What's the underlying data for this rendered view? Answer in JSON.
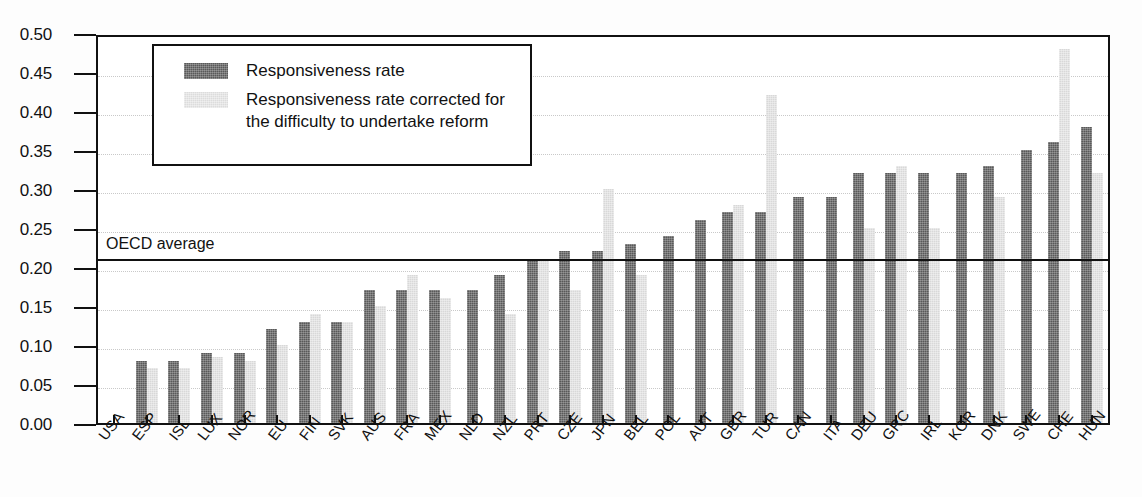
{
  "chart_data": {
    "type": "bar",
    "title": "",
    "subtitle": "",
    "xlabel": "",
    "ylabel": "",
    "ylim": [
      0.0,
      0.5
    ],
    "ytick_labels": [
      "0.50",
      "0.45",
      "0.40",
      "0.35",
      "0.30",
      "0.25",
      "0.20",
      "0.15",
      "0.10",
      "0.05",
      "0.00"
    ],
    "ytick_values": [
      0.5,
      0.45,
      0.4,
      0.35,
      0.3,
      0.25,
      0.2,
      0.15,
      0.1,
      0.05,
      0.0
    ],
    "grid": true,
    "legend_position": "upper-left-inside",
    "categories": [
      "USA",
      "ESP",
      "ISL",
      "LUX",
      "NOR",
      "EU",
      "FIN",
      "SVK",
      "AUS",
      "FRA",
      "MEX",
      "NLD",
      "NZL",
      "PRT",
      "CZE",
      "JPN",
      "BEL",
      "POL",
      "AUT",
      "GBR",
      "TUR",
      "CAN",
      "ITA",
      "DEU",
      "GRC",
      "IRL",
      "KOR",
      "DNK",
      "SWE",
      "CHE",
      "HUN"
    ],
    "series": [
      {
        "name": "Responsiveness rate",
        "color": "#595959",
        "values": [
          0.0,
          0.08,
          0.08,
          0.09,
          0.09,
          0.12,
          0.13,
          0.13,
          0.17,
          0.17,
          0.17,
          0.17,
          0.19,
          0.21,
          0.22,
          0.22,
          0.23,
          0.24,
          0.26,
          0.27,
          0.27,
          0.29,
          0.29,
          0.32,
          0.32,
          0.32,
          0.32,
          0.33,
          0.35,
          0.36,
          0.38
        ]
      },
      {
        "name": "Responsiveness rate corrected for the difficulty to undertake reform",
        "color": "#d8d8d8",
        "values": [
          0.0,
          0.07,
          0.07,
          0.085,
          0.08,
          0.1,
          0.14,
          0.13,
          0.15,
          0.19,
          0.16,
          0.0,
          0.14,
          0.21,
          0.17,
          0.3,
          0.19,
          0.0,
          0.0,
          0.28,
          0.42,
          0.0,
          0.0,
          0.25,
          0.33,
          0.25,
          0.0,
          0.29,
          0.0,
          0.48,
          0.32
        ]
      }
    ],
    "annotations": [
      {
        "name": "oecd-average",
        "label": "OECD average",
        "value": 0.215,
        "type": "hline",
        "color": "#111111"
      }
    ]
  },
  "legend": {
    "entries": [
      {
        "label": "Responsiveness rate",
        "swatch": "dark"
      },
      {
        "label": "Responsiveness rate corrected for the difficulty to undertake reform",
        "swatch": "light"
      }
    ]
  },
  "axis": {
    "average_label": "OECD average"
  }
}
